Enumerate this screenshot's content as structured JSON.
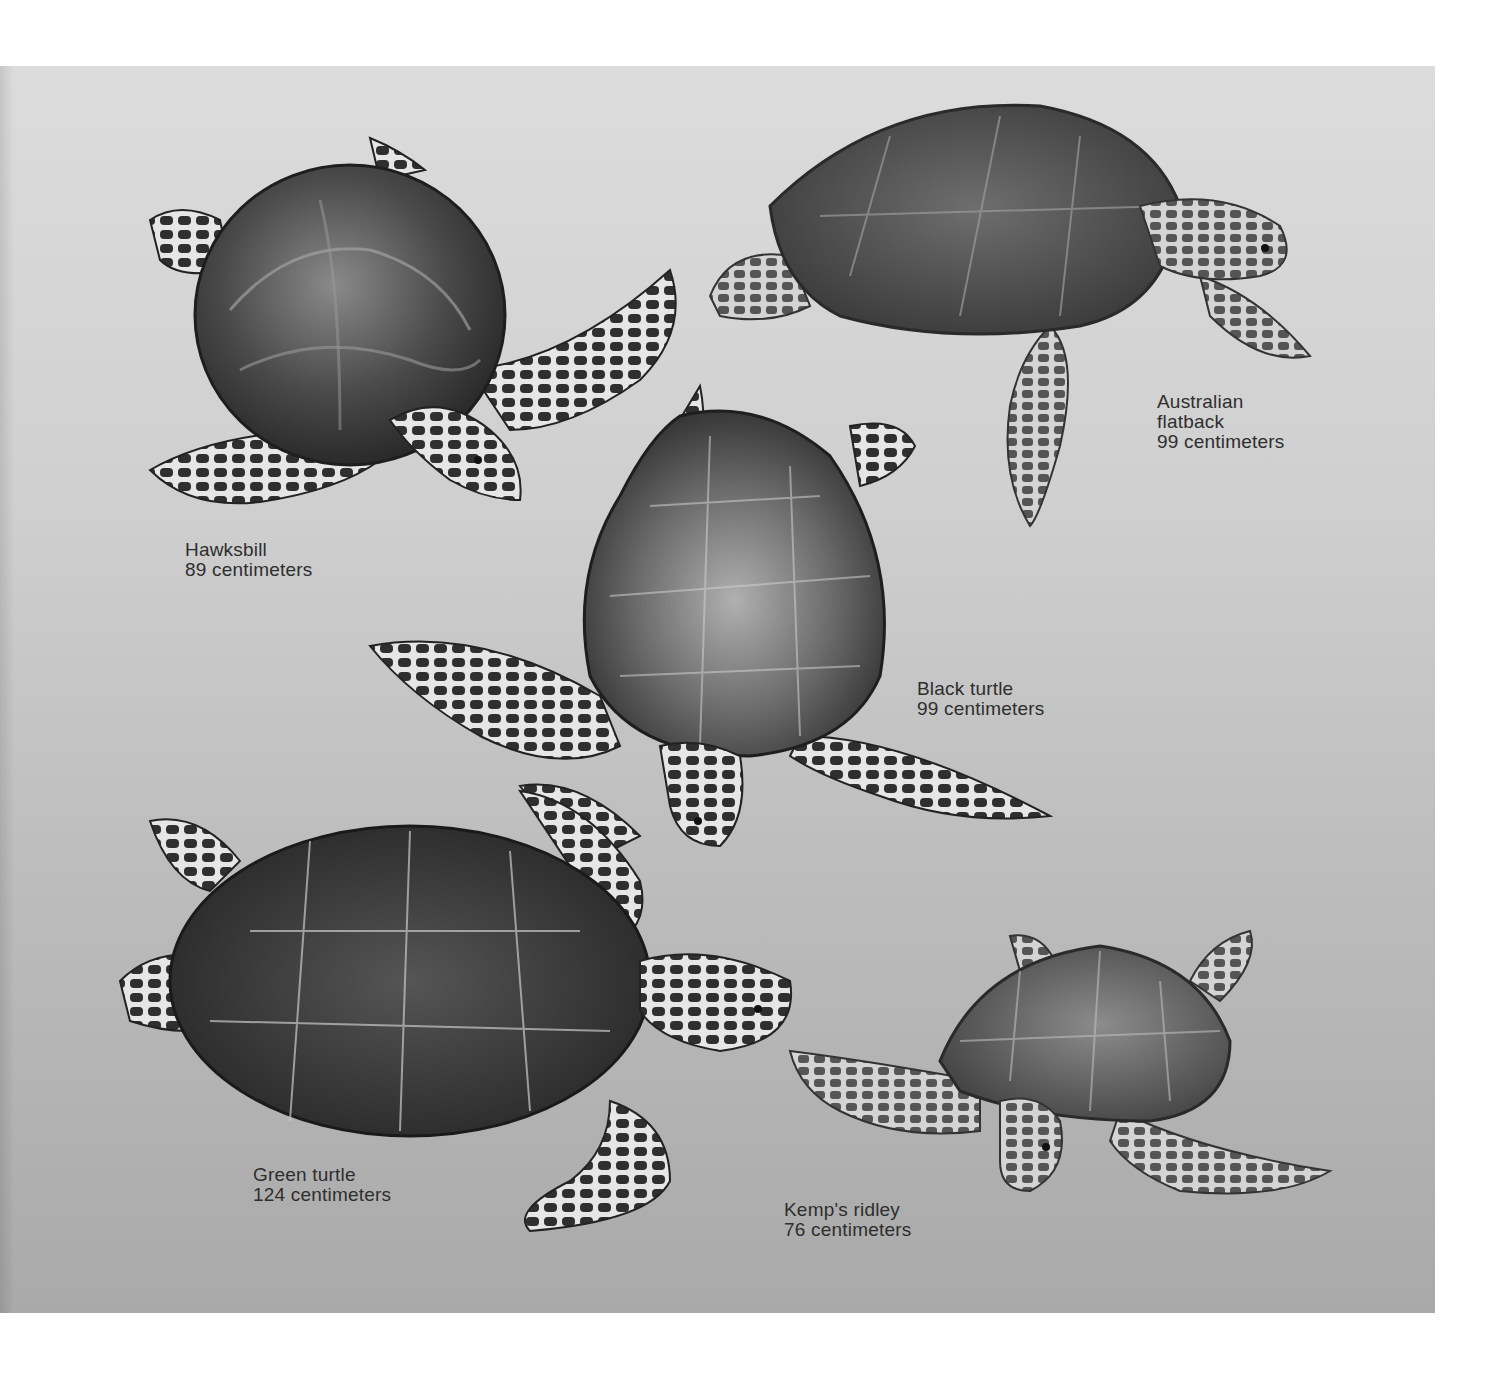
{
  "figure": {
    "background": {
      "panel_top_color": "#dcdcdc",
      "panel_bottom_color": "#a9a9a9",
      "page_color": "#ffffff"
    },
    "turtles": [
      {
        "id": "hawksbill",
        "name": "Hawksbill",
        "size": "89 centimeters"
      },
      {
        "id": "australian-flatback",
        "name_line1": "Australian",
        "name_line2": "flatback",
        "size": "99 centimeters"
      },
      {
        "id": "black-turtle",
        "name": "Black turtle",
        "size": "99 centimeters"
      },
      {
        "id": "green-turtle",
        "name": "Green turtle",
        "size": "124 centimeters"
      },
      {
        "id": "kemps-ridley",
        "name": "Kemp's ridley",
        "size": "76 centimeters"
      }
    ]
  }
}
